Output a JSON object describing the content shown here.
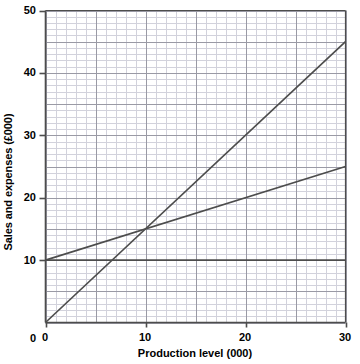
{
  "chart_data": {
    "type": "line",
    "title": "",
    "xlabel": "Production level (000)",
    "ylabel": "Sales and expenses (£000)",
    "xlim": [
      0,
      30
    ],
    "ylim": [
      0,
      50
    ],
    "xticks": [
      0,
      10,
      20,
      30
    ],
    "yticks": [
      0,
      10,
      20,
      30,
      40,
      50
    ],
    "grid": true,
    "grid_minor": true,
    "grid_minor_step_x": 1,
    "grid_minor_step_y": 1,
    "grid_major_step_x": 5,
    "grid_major_step_y": 5,
    "legend": "none",
    "series": [
      {
        "name": "sales",
        "description": "Sales revenue line through the origin",
        "x": [
          0,
          30
        ],
        "values": [
          0,
          45
        ],
        "slope": 1.5,
        "intercept": 0,
        "color": "#4d4d4d"
      },
      {
        "name": "total-cost",
        "description": "Total cost line starting at fixed cost 10",
        "x": [
          0,
          30
        ],
        "values": [
          10,
          25
        ],
        "slope": 0.5,
        "intercept": 10,
        "color": "#4d4d4d"
      },
      {
        "name": "fixed-cost",
        "description": "Fixed cost horizontal line",
        "x": [
          0,
          30
        ],
        "values": [
          10,
          10
        ],
        "slope": 0,
        "intercept": 10,
        "color": "#4d4d4d"
      }
    ],
    "intersection": {
      "x": 10,
      "y": 15
    }
  },
  "axes": {
    "x_tick_labels": [
      "0",
      "10",
      "20",
      "30"
    ],
    "y_tick_labels": [
      "0",
      "10",
      "20",
      "30",
      "40",
      "50"
    ],
    "x_title": "Production level (000)",
    "y_title": "Sales and expenses (£000)"
  },
  "colors": {
    "line": "#4d4d4d",
    "axis": "#4d4d4d",
    "grid_major": "#9a9aa5",
    "grid_minor": "#d2d2dc",
    "background": "#ffffff",
    "text": "#000000"
  }
}
